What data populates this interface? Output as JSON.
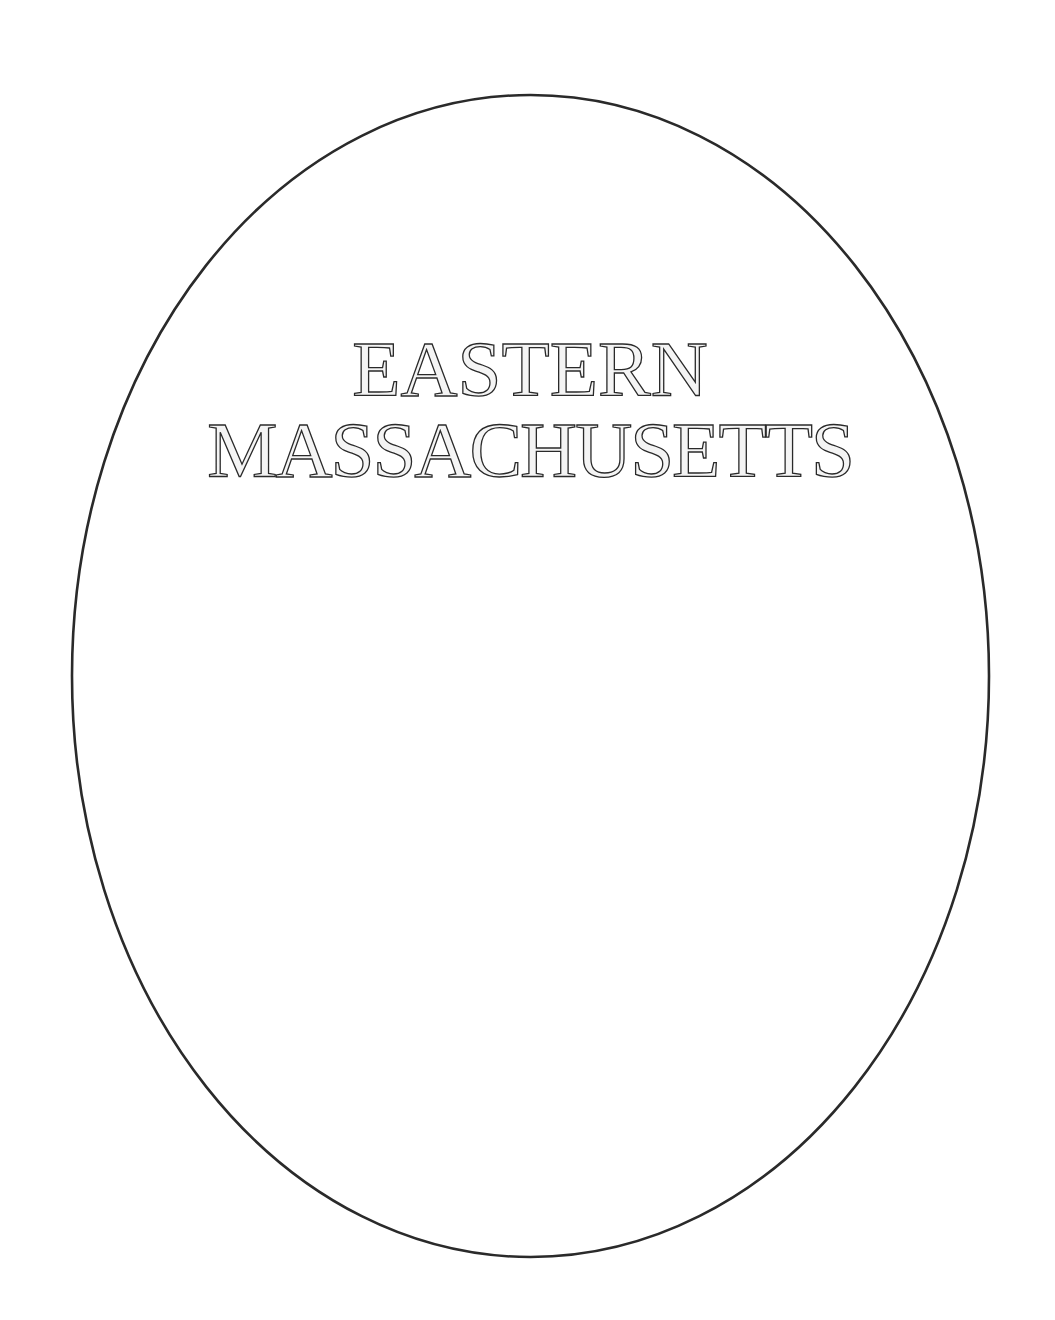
{
  "page": {
    "background": "#ffffff",
    "frame": {
      "shape": "oval",
      "stroke_color": "#2a2a2a",
      "center_x": 530.5,
      "center_y": 676,
      "radius_x": 458.5,
      "radius_y": 581,
      "stroke_width": 2.6
    },
    "title": {
      "line1": "EASTERN",
      "line2": "MASSACHUSETTS",
      "style": "inline-outlined serif capitals"
    }
  }
}
